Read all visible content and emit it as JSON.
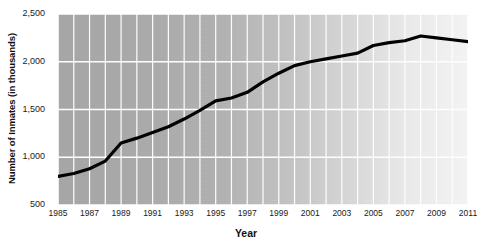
{
  "chart_data": {
    "type": "line",
    "title": "",
    "xlabel": "Year",
    "ylabel": "Number of Inmates (in thousands)",
    "xlim": [
      1985,
      2011
    ],
    "ylim": [
      500,
      2500
    ],
    "ytick_labels": [
      "2,500",
      "2,000",
      "1,500",
      "1,000",
      "500"
    ],
    "ytick_values": [
      2500,
      2000,
      1500,
      1000,
      500
    ],
    "xtick_labels": [
      "1985",
      "1987",
      "1989",
      "1991",
      "1993",
      "1995",
      "1997",
      "1999",
      "2001",
      "2003",
      "2005",
      "2007",
      "2009",
      "2011"
    ],
    "xtick_values": [
      1985,
      1987,
      1989,
      1991,
      1993,
      1995,
      1997,
      1999,
      2001,
      2003,
      2005,
      2007,
      2009,
      2011
    ],
    "grid": true,
    "grid_color": "#ffffff",
    "grid_x_step": 1,
    "legend": false,
    "line_color": "#000000",
    "line_width": 3.2,
    "plot_background": "gray-to-white horizontal gradient",
    "x": [
      1985,
      1986,
      1987,
      1988,
      1989,
      1990,
      1991,
      1992,
      1993,
      1994,
      1995,
      1996,
      1997,
      1998,
      1999,
      2000,
      2001,
      2002,
      2003,
      2004,
      2005,
      2006,
      2007,
      2008,
      2009,
      2010,
      2011
    ],
    "values": [
      800,
      830,
      880,
      960,
      1150,
      1200,
      1260,
      1320,
      1400,
      1490,
      1590,
      1620,
      1680,
      1790,
      1880,
      1960,
      2000,
      2030,
      2060,
      2090,
      2170,
      2200,
      2220,
      2270,
      2250,
      2230,
      2210
    ],
    "series": [
      {
        "name": "Number of Inmates",
        "values": [
          800,
          830,
          880,
          960,
          1150,
          1200,
          1260,
          1320,
          1400,
          1490,
          1590,
          1620,
          1680,
          1790,
          1880,
          1960,
          2000,
          2030,
          2060,
          2090,
          2170,
          2200,
          2220,
          2270,
          2250,
          2230,
          2210
        ]
      }
    ]
  }
}
